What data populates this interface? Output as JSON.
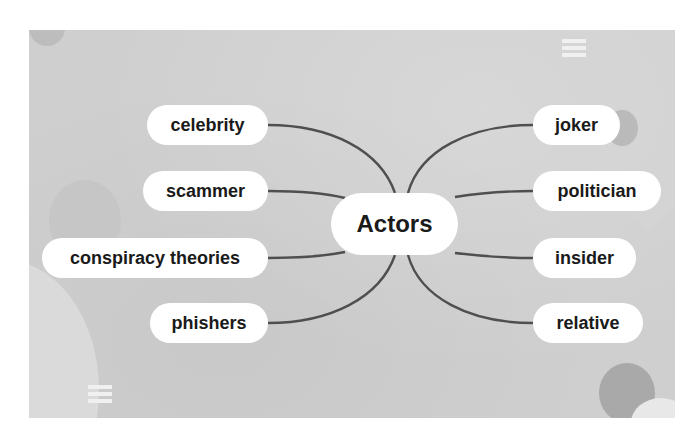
{
  "diagram": {
    "type": "mind-map",
    "center": {
      "label": "Actors"
    },
    "left_nodes": [
      {
        "label": "celebrity"
      },
      {
        "label": "scammer"
      },
      {
        "label": "conspiracy theories"
      },
      {
        "label": "phishers"
      }
    ],
    "right_nodes": [
      {
        "label": "joker"
      },
      {
        "label": "politician"
      },
      {
        "label": "insider"
      },
      {
        "label": "relative"
      }
    ]
  },
  "icons": {
    "top_menu": "menu-icon",
    "bottom_menu": "menu-icon"
  },
  "colors": {
    "background": "#cfcfcf",
    "node_fill": "#ffffff",
    "edge_stroke": "#4f4f4f",
    "text": "#1a1a1a"
  }
}
